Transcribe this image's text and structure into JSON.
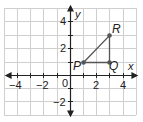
{
  "figure": {
    "type": "coordinate-plane",
    "x_axis_label": "x",
    "y_axis_label": "y",
    "origin_label": "0",
    "x_ticks": [
      {
        "value": -4,
        "label": "−4"
      },
      {
        "value": -2,
        "label": "−2"
      },
      {
        "value": 2,
        "label": "2"
      },
      {
        "value": 4,
        "label": "4"
      }
    ],
    "y_ticks": [
      {
        "value": 4,
        "label": "4"
      },
      {
        "value": 2,
        "label": "2"
      },
      {
        "value": -2,
        "label": "−2"
      }
    ],
    "points": [
      {
        "name": "P",
        "x": 1,
        "y": 1
      },
      {
        "name": "Q",
        "x": 3,
        "y": 1
      },
      {
        "name": "R",
        "x": 3,
        "y": 3
      }
    ],
    "shape": "triangle PQR",
    "colors": {
      "grid": "#cfcfcf",
      "axis": "#222222",
      "triangle": "#555555",
      "point": "#555555"
    }
  }
}
